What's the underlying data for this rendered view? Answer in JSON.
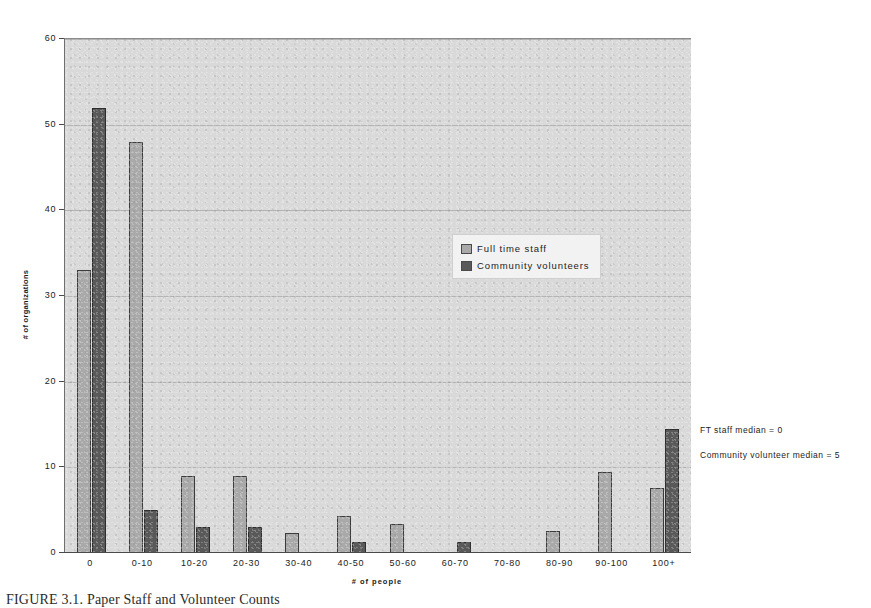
{
  "chart_data": {
    "type": "bar",
    "title": "",
    "xlabel": "# of people",
    "ylabel": "# of organizations",
    "ylim": [
      0,
      60
    ],
    "yticks": [
      0,
      10,
      20,
      30,
      40,
      50,
      60
    ],
    "grid": true,
    "legend_position": "inside-center-right",
    "categories": [
      "0",
      "0-10",
      "10-20",
      "20-30",
      "30-40",
      "40-50",
      "50-60",
      "60-70",
      "70-80",
      "80-90",
      "90-100",
      "100+"
    ],
    "series": [
      {
        "name": "Full time staff",
        "color": "#a9a9a9",
        "values": [
          33,
          48,
          9,
          9,
          2.3,
          4.3,
          3.4,
          0,
          0,
          2.6,
          9.5,
          7.6
        ]
      },
      {
        "name": "Community volunteers",
        "color": "#595959",
        "values": [
          52,
          5,
          3,
          3,
          0,
          1.3,
          0,
          1.3,
          0,
          0,
          0,
          14.5
        ]
      }
    ],
    "annotations": [
      "FT staff median = 0",
      "Community volunteer median = 5"
    ]
  },
  "legend": {
    "items": [
      {
        "label": "Full time staff",
        "color": "#a9a9a9"
      },
      {
        "label": "Community volunteers",
        "color": "#595959"
      }
    ]
  },
  "axes": {
    "y_title": "# of organizations",
    "x_title": "# of people",
    "y_ticks": [
      "0",
      "10",
      "20",
      "30",
      "40",
      "50",
      "60"
    ],
    "x_ticks": [
      "0",
      "0-10",
      "10-20",
      "20-30",
      "30-40",
      "40-50",
      "50-60",
      "60-70",
      "70-80",
      "80-90",
      "90-100",
      "100+"
    ]
  },
  "annotations": {
    "ft_staff_median": "FT staff median = 0",
    "community_volunteer_median": "Community volunteer median = 5"
  },
  "caption": {
    "text": "FIGURE 3.1.    Paper    Staff and Volunteer Counts"
  },
  "colors": {
    "plot_background": "#d9d9d9",
    "series_light": "#a9a9a9",
    "series_dark": "#595959",
    "gridline": "#b4b4b4",
    "axis": "#4a4a4a"
  }
}
